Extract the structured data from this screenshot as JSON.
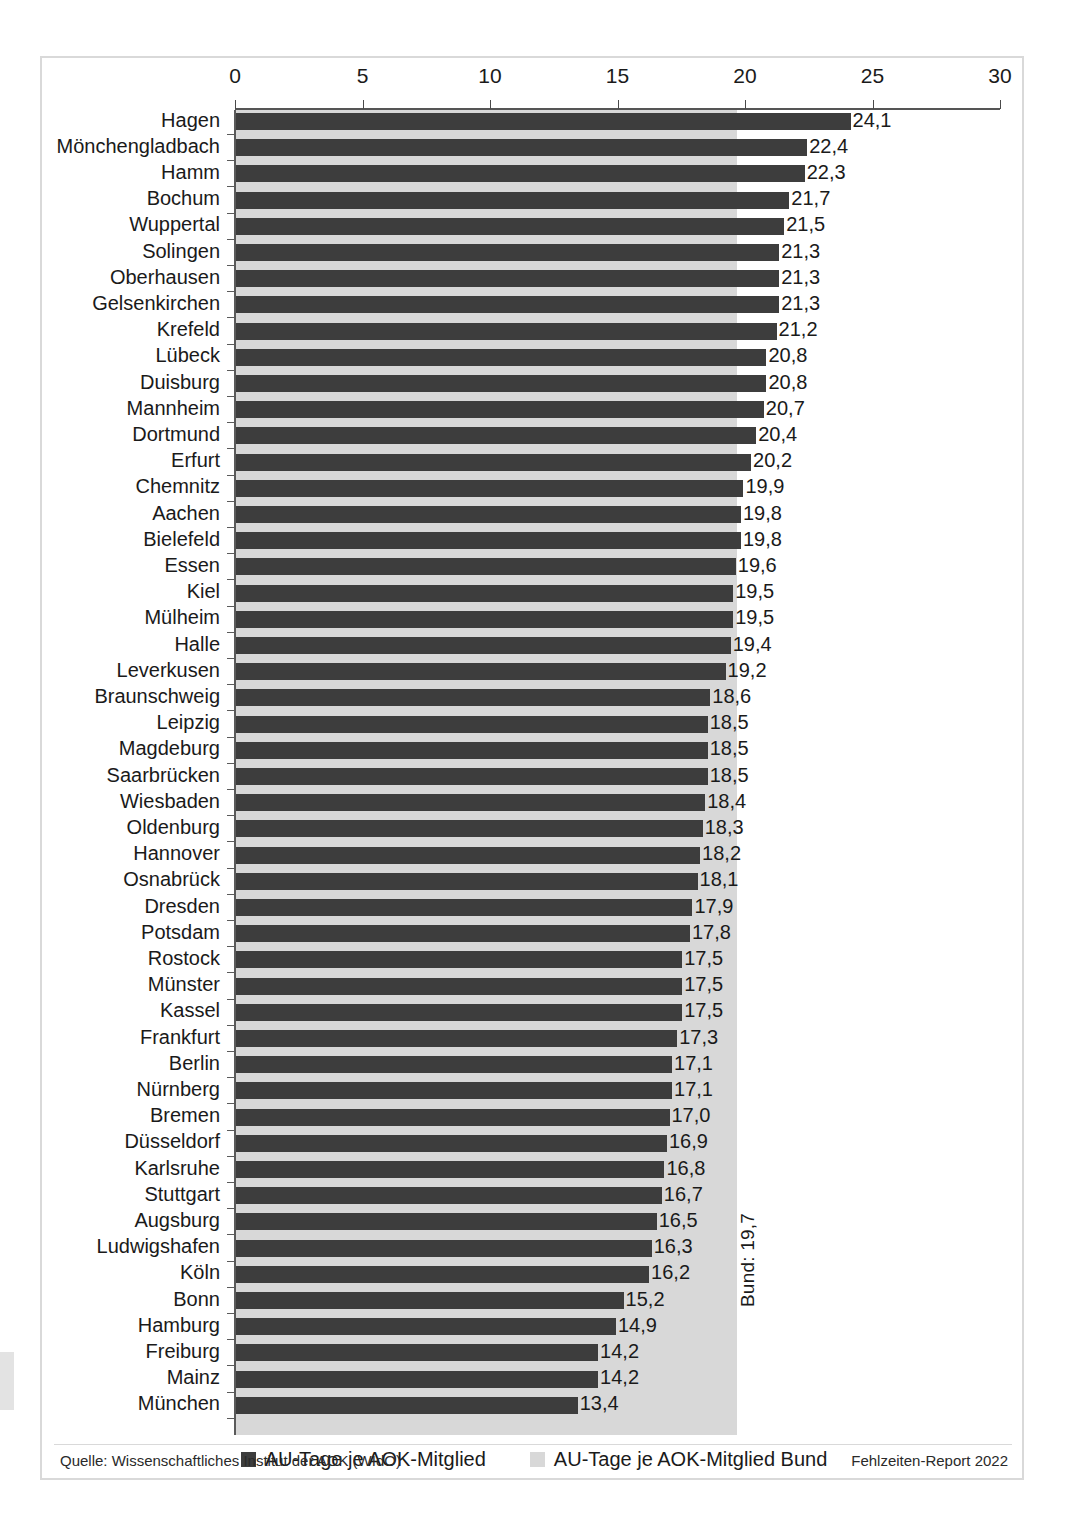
{
  "chart_data": {
    "type": "bar",
    "orientation": "horizontal",
    "title": "",
    "xlabel": "",
    "ylabel": "",
    "xlim": [
      0,
      30
    ],
    "xticks": [
      0,
      5,
      10,
      15,
      20,
      25,
      30
    ],
    "xtick_labels": [
      "0",
      "5",
      "10",
      "15",
      "20",
      "25",
      "30"
    ],
    "grid": false,
    "categories": [
      "Hagen",
      "Mönchengladbach",
      "Hamm",
      "Bochum",
      "Wuppertal",
      "Solingen",
      "Oberhausen",
      "Gelsenkirchen",
      "Krefeld",
      "Lübeck",
      "Duisburg",
      "Mannheim",
      "Dortmund",
      "Erfurt",
      "Chemnitz",
      "Aachen",
      "Bielefeld",
      "Essen",
      "Kiel",
      "Mülheim",
      "Halle",
      "Leverkusen",
      "Braunschweig",
      "Leipzig",
      "Magdeburg",
      "Saarbrücken",
      "Wiesbaden",
      "Oldenburg",
      "Hannover",
      "Osnabrück",
      "Dresden",
      "Potsdam",
      "Rostock",
      "Münster",
      "Kassel",
      "Frankfurt",
      "Berlin",
      "Nürnberg",
      "Bremen",
      "Düsseldorf",
      "Karlsruhe",
      "Stuttgart",
      "Augsburg",
      "Ludwigshafen",
      "Köln",
      "Bonn",
      "Hamburg",
      "Freiburg",
      "Mainz",
      "München"
    ],
    "values": [
      24.1,
      22.4,
      22.3,
      21.7,
      21.5,
      21.3,
      21.3,
      21.3,
      21.2,
      20.8,
      20.8,
      20.7,
      20.4,
      20.2,
      19.9,
      19.8,
      19.8,
      19.6,
      19.5,
      19.5,
      19.4,
      19.2,
      18.6,
      18.5,
      18.5,
      18.5,
      18.4,
      18.3,
      18.2,
      18.1,
      17.9,
      17.8,
      17.5,
      17.5,
      17.5,
      17.3,
      17.1,
      17.1,
      17.0,
      16.9,
      16.8,
      16.7,
      16.5,
      16.3,
      16.2,
      15.2,
      14.9,
      14.2,
      14.2,
      13.4
    ],
    "value_labels": [
      "24,1",
      "22,4",
      "22,3",
      "21,7",
      "21,5",
      "21,3",
      "21,3",
      "21,3",
      "21,2",
      "20,8",
      "20,8",
      "20,7",
      "20,4",
      "20,2",
      "19,9",
      "19,8",
      "19,8",
      "19,6",
      "19,5",
      "19,5",
      "19,4",
      "19,2",
      "18,6",
      "18,5",
      "18,5",
      "18,5",
      "18,4",
      "18,3",
      "18,2",
      "18,1",
      "17,9",
      "17,8",
      "17,5",
      "17,5",
      "17,5",
      "17,3",
      "17,1",
      "17,1",
      "17,0",
      "16,9",
      "16,8",
      "16,7",
      "16,5",
      "16,3",
      "16,2",
      "15,2",
      "14,9",
      "14,2",
      "14,2",
      "13,4"
    ],
    "reference": {
      "name": "Bund",
      "value": 19.7,
      "label": "Bund: 19,7"
    },
    "colors": {
      "bar": "#3d3d3d",
      "reference_band": "#d8d8d8",
      "axis": "#555555",
      "text": "#1a1a1a",
      "frame": "#d9d9d9"
    },
    "legend": {
      "position": "bottom",
      "entries": [
        {
          "label": "AU-Tage je AOK-Mitglied",
          "color": "#3d3d3d"
        },
        {
          "label": "AU-Tage je AOK-Mitglied Bund",
          "color": "#d8d8d8"
        }
      ]
    }
  },
  "footer": {
    "source": "Quelle: Wissenschaftliches Institut der AOK (WIdO)",
    "report": "Fehlzeiten-Report 2022"
  }
}
